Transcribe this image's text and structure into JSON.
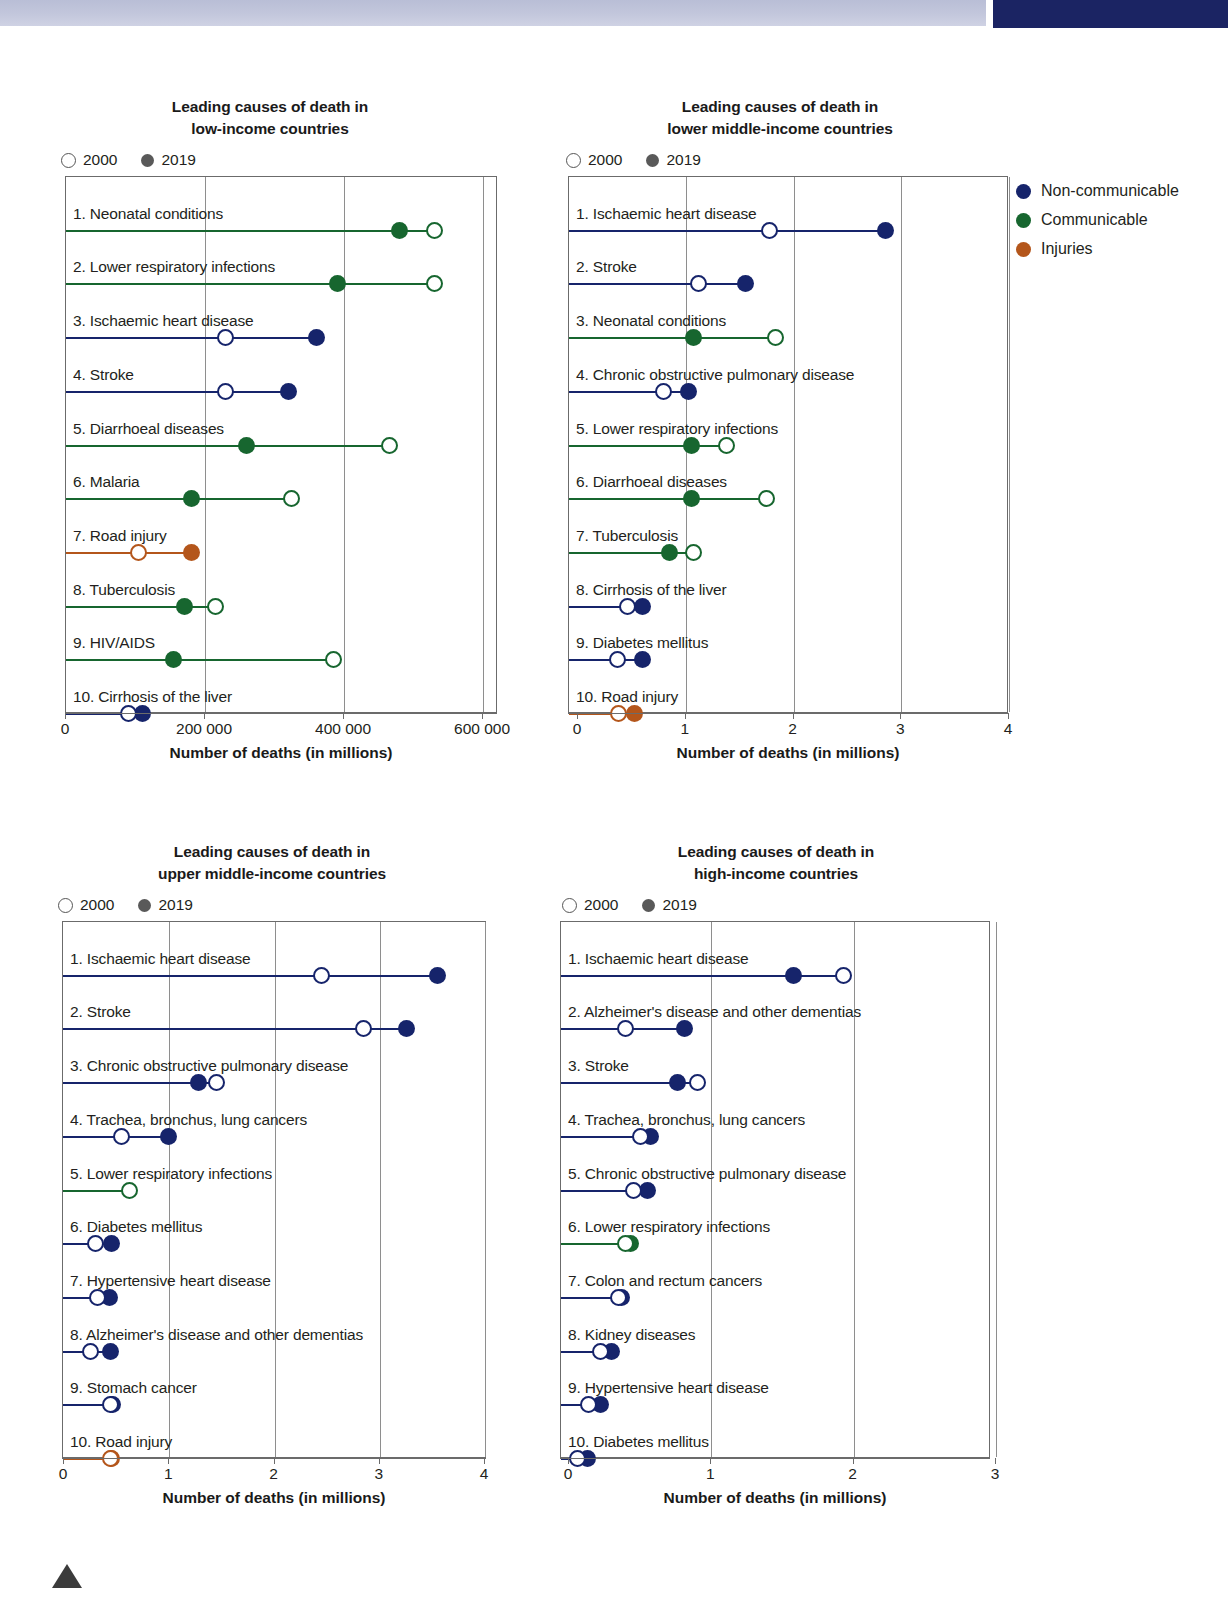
{
  "legend_years": {
    "open_label": "2000",
    "filled_label": "2019"
  },
  "category_legend": {
    "items": [
      {
        "label": "Non-communicable",
        "color": "#16246b"
      },
      {
        "label": "Communicable",
        "color": "#17662f"
      },
      {
        "label": "Injuries",
        "color": "#b4561b"
      }
    ]
  },
  "axis_title": "Number of deaths (in millions)",
  "colors": {
    "noncommunicable": "#16246b",
    "communicable": "#17662f",
    "injuries": "#b4561b",
    "band": "#c3c7dc",
    "block": "#1b2463"
  },
  "chart_data": [
    {
      "id": "low-income",
      "type": "bar",
      "title": "Leading causes of death in low-income countries",
      "title_line1": "Leading causes of death in",
      "title_line2": "low-income countries",
      "xlabel": "Number of deaths (in millions)",
      "ylabel": "",
      "xlim": [
        0,
        620000
      ],
      "ticks": [
        0,
        200000,
        400000,
        600000
      ],
      "tick_labels": [
        "0",
        "200 000",
        "400 000",
        "600 000"
      ],
      "grid": true,
      "legend_position": "top-left",
      "series": [
        {
          "name": "2000",
          "marker": "open"
        },
        {
          "name": "2019",
          "marker": "filled"
        }
      ],
      "rows": [
        {
          "rank": "1.",
          "label": "Neonatal conditions",
          "category": "communicable",
          "v2000": 530000,
          "v2019": 480000
        },
        {
          "rank": "2.",
          "label": "Lower respiratory infections",
          "category": "communicable",
          "v2000": 530000,
          "v2019": 390000
        },
        {
          "rank": "3.",
          "label": "Ischaemic heart disease",
          "category": "noncommunicable",
          "v2000": 230000,
          "v2019": 360000
        },
        {
          "rank": "4.",
          "label": "Stroke",
          "category": "noncommunicable",
          "v2000": 230000,
          "v2019": 320000
        },
        {
          "rank": "5.",
          "label": "Diarrhoeal diseases",
          "category": "communicable",
          "v2000": 465000,
          "v2019": 260000
        },
        {
          "rank": "6.",
          "label": "Malaria",
          "category": "communicable",
          "v2000": 325000,
          "v2019": 180000
        },
        {
          "rank": "7.",
          "label": "Road injury",
          "category": "injuries",
          "v2000": 105000,
          "v2019": 180000
        },
        {
          "rank": "8.",
          "label": "Tuberculosis",
          "category": "communicable",
          "v2000": 215000,
          "v2019": 170000
        },
        {
          "rank": "9.",
          "label": "HIV/AIDS",
          "category": "communicable",
          "v2000": 385000,
          "v2019": 155000
        },
        {
          "rank": "10.",
          "label": "Cirrhosis of the liver",
          "category": "noncommunicable",
          "v2000": 90000,
          "v2019": 110000
        }
      ]
    },
    {
      "id": "lower-middle-income",
      "type": "bar",
      "title": "Leading causes of death in lower middle-income countries",
      "title_line1": "Leading causes of death in",
      "title_line2": "lower middle-income countries",
      "xlabel": "Number of deaths (in millions)",
      "ylabel": "",
      "xlim": [
        0,
        4
      ],
      "ticks": [
        0,
        1,
        2,
        3,
        4
      ],
      "tick_labels": [
        "0",
        "1",
        "2",
        "3",
        "4"
      ],
      "grid": true,
      "legend_position": "top-left",
      "series": [
        {
          "name": "2000",
          "marker": "open"
        },
        {
          "name": "2019",
          "marker": "filled"
        }
      ],
      "rows": [
        {
          "rank": "1.",
          "label": "Ischaemic heart disease",
          "category": "noncommunicable",
          "v2000": 1.78,
          "v2019": 2.85
        },
        {
          "rank": "2.",
          "label": "Stroke",
          "category": "noncommunicable",
          "v2000": 1.12,
          "v2019": 1.55
        },
        {
          "rank": "3.",
          "label": "Neonatal conditions",
          "category": "communicable",
          "v2000": 1.83,
          "v2019": 1.07
        },
        {
          "rank": "4.",
          "label": "Chronic obstructive pulmonary disease",
          "category": "noncommunicable",
          "v2000": 0.79,
          "v2019": 1.03
        },
        {
          "rank": "5.",
          "label": "Lower respiratory infections",
          "category": "communicable",
          "v2000": 1.38,
          "v2019": 1.05
        },
        {
          "rank": "6.",
          "label": "Diarrhoeal diseases",
          "category": "communicable",
          "v2000": 1.75,
          "v2019": 1.05
        },
        {
          "rank": "7.",
          "label": "Tuberculosis",
          "category": "communicable",
          "v2000": 1.07,
          "v2019": 0.85
        },
        {
          "rank": "8.",
          "label": "Cirrhosis of the liver",
          "category": "noncommunicable",
          "v2000": 0.46,
          "v2019": 0.6
        },
        {
          "rank": "9.",
          "label": "Diabetes mellitus",
          "category": "noncommunicable",
          "v2000": 0.37,
          "v2019": 0.6
        },
        {
          "rank": "10.",
          "label": "Road injury",
          "category": "injuries",
          "v2000": 0.38,
          "v2019": 0.52
        }
      ]
    },
    {
      "id": "upper-middle-income",
      "type": "bar",
      "title": "Leading causes of death in upper middle-income countries",
      "title_line1": "Leading causes of death in",
      "title_line2": "upper middle-income countries",
      "xlabel": "Number of deaths (in millions)",
      "ylabel": "",
      "xlim": [
        0,
        4
      ],
      "ticks": [
        0,
        1,
        2,
        3,
        4
      ],
      "tick_labels": [
        "0",
        "1",
        "2",
        "3",
        "4"
      ],
      "grid": true,
      "legend_position": "top-left",
      "series": [
        {
          "name": "2000",
          "marker": "open"
        },
        {
          "name": "2019",
          "marker": "filled"
        }
      ],
      "rows": [
        {
          "rank": "1.",
          "label": "Ischaemic heart disease",
          "category": "noncommunicable",
          "v2000": 2.45,
          "v2019": 3.55
        },
        {
          "rank": "2.",
          "label": "Stroke",
          "category": "noncommunicable",
          "v2000": 2.85,
          "v2019": 3.25
        },
        {
          "rank": "3.",
          "label": "Chronic obstructive pulmonary disease",
          "category": "noncommunicable",
          "v2000": 1.45,
          "v2019": 1.28
        },
        {
          "rank": "4.",
          "label": "Trachea, bronchus, lung cancers",
          "category": "noncommunicable",
          "v2000": 0.55,
          "v2019": 0.99
        },
        {
          "rank": "5.",
          "label": "Lower respiratory infections",
          "category": "communicable",
          "v2000": 0.62,
          "v2019": 0.0
        },
        {
          "rank": "6.",
          "label": "Diabetes mellitus",
          "category": "noncommunicable",
          "v2000": 0.3,
          "v2019": 0.45
        },
        {
          "rank": "7.",
          "label": "Hypertensive heart disease",
          "category": "noncommunicable",
          "v2000": 0.32,
          "v2019": 0.43
        },
        {
          "rank": "8.",
          "label": "Alzheimer's disease and other dementias",
          "category": "noncommunicable",
          "v2000": 0.25,
          "v2019": 0.44
        },
        {
          "rank": "9.",
          "label": "Stomach cancer",
          "category": "noncommunicable",
          "v2000": 0.44,
          "v2019": 0.46
        },
        {
          "rank": "10.",
          "label": "Road injury",
          "category": "injuries",
          "v2000": 0.44,
          "v2019": 0.45
        }
      ]
    },
    {
      "id": "high-income",
      "type": "bar",
      "title": "Leading causes of death in high-income countries",
      "title_line1": "Leading causes of death in",
      "title_line2": "high-income countries",
      "xlabel": "Number of deaths (in millions)",
      "ylabel": "",
      "xlim": [
        0,
        3
      ],
      "ticks": [
        0,
        1,
        2,
        3
      ],
      "tick_labels": [
        "0",
        "1",
        "2",
        "3"
      ],
      "grid": true,
      "legend_position": "top-left",
      "series": [
        {
          "name": "2000",
          "marker": "open"
        },
        {
          "name": "2019",
          "marker": "filled"
        }
      ],
      "rows": [
        {
          "rank": "1.",
          "label": "Ischaemic heart disease",
          "category": "noncommunicable",
          "v2000": 1.93,
          "v2019": 1.58
        },
        {
          "rank": "2.",
          "label": "Alzheimer's disease and other dementias",
          "category": "noncommunicable",
          "v2000": 0.4,
          "v2019": 0.81
        },
        {
          "rank": "3.",
          "label": "Stroke",
          "category": "noncommunicable",
          "v2000": 0.9,
          "v2019": 0.76
        },
        {
          "rank": "4.",
          "label": "Trachea, bronchus, lung cancers",
          "category": "noncommunicable",
          "v2000": 0.5,
          "v2019": 0.57
        },
        {
          "rank": "5.",
          "label": "Chronic obstructive pulmonary disease",
          "category": "noncommunicable",
          "v2000": 0.45,
          "v2019": 0.55
        },
        {
          "rank": "6.",
          "label": "Lower respiratory infections",
          "category": "communicable",
          "v2000": 0.4,
          "v2019": 0.43
        },
        {
          "rank": "7.",
          "label": "Colon and rectum cancers",
          "category": "noncommunicable",
          "v2000": 0.35,
          "v2019": 0.37
        },
        {
          "rank": "8.",
          "label": "Kidney diseases",
          "category": "noncommunicable",
          "v2000": 0.22,
          "v2019": 0.3
        },
        {
          "rank": "9.",
          "label": "Hypertensive heart disease",
          "category": "noncommunicable",
          "v2000": 0.14,
          "v2019": 0.22
        },
        {
          "rank": "10.",
          "label": "Diabetes mellitus",
          "category": "noncommunicable",
          "v2000": 0.06,
          "v2019": 0.13
        }
      ]
    }
  ]
}
